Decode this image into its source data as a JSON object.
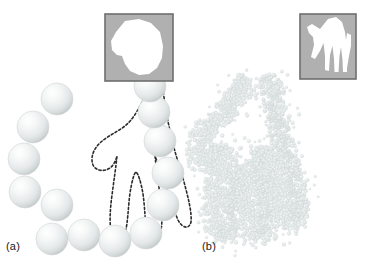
{
  "figure": {
    "type": "diagram",
    "background_color": "#ffffff"
  },
  "panels": [
    {
      "id": "a",
      "label": "(a)",
      "marker_kind": "sphere",
      "marker_count": 14,
      "marker_diameter_px": 32,
      "marker_fill_light": "#ffffff",
      "marker_fill_mid": "#eceeee",
      "marker_fill_dark": "#c9cdcd",
      "contour_style": "dashed",
      "contour_color": "#2b2b2b",
      "contour_dash": "2.2 2.2",
      "contour_width_px": 1.6,
      "spheres": [
        {
          "cx": 57,
          "cy": 99
        },
        {
          "cx": 33,
          "cy": 127
        },
        {
          "cx": 24,
          "cy": 159
        },
        {
          "cx": 25,
          "cy": 192
        },
        {
          "cx": 57,
          "cy": 205
        },
        {
          "cx": 52,
          "cy": 239
        },
        {
          "cx": 84,
          "cy": 235
        },
        {
          "cx": 115,
          "cy": 241
        },
        {
          "cx": 146,
          "cy": 233
        },
        {
          "cx": 163,
          "cy": 205
        },
        {
          "cx": 168,
          "cy": 173
        },
        {
          "cx": 160,
          "cy": 141
        },
        {
          "cx": 154,
          "cy": 112
        },
        {
          "cx": 150,
          "cy": 86
        }
      ],
      "inset": {
        "x": 105,
        "y": 14,
        "width": 68,
        "height": 67,
        "border_color": "#6e6e6e",
        "background_color": "#b0b0b0",
        "shape_color": "#ffffff",
        "shape_name": "partial-hand-silhouette"
      }
    },
    {
      "id": "b",
      "label": "(b)",
      "marker_kind": "dot",
      "marker_count": 1100,
      "marker_diameter_px": 3.2,
      "marker_fill": "#e2e6e6",
      "marker_stroke": "#d2d8d8",
      "contour_style": "point-cloud",
      "inset": {
        "x": 300,
        "y": 14,
        "width": 56,
        "height": 65,
        "border_color": "#6e6e6e",
        "background_color": "#b0b0b0",
        "shape_color": "#ffffff",
        "shape_name": "full-hand-silhouette"
      }
    }
  ],
  "hand_outline_points": "150,86 142,104 133,120 120,132 106,139 96,149 92,160 96,168 104,170 112,166 116,158 116,168 114,182 112,196 110,212 110,228 114,236 120,238 125,232 127,218 129,202 132,186 136,176 140,186 143,202 145,218 147,232 152,238 158,236 161,228 161,212 159,196 157,182 155,168 155,158 159,168 163,178 168,190 172,204 176,218 181,228 187,229 191,222 189,208 185,192 181,176 177,162 173,150 170,138 167,126 165,112 163,98",
  "inset_shapes": {
    "left_partial_hand_path": "M 18 6 L 44 4 L 56 16 L 60 34 L 58 48 L 48 58 L 34 60 L 22 54 L 16 44 L 10 40 L 6 30 L 10 18 Z",
    "right_hand_path": "M 30 4 L 40 2 L 46 14 L 48 26 L 50 18 L 54 22 L 53 34 L 50 44 L 48 56 L 44 56 L 43 44 L 41 34 L 39 44 L 38 58 L 34 58 L 33 44 L 31 32 L 28 42 L 27 56 L 23 55 L 23 40 L 22 28 L 18 36 L 14 44 L 10 42 L 13 30 L 12 22 L 8 18 L 6 12 L 12 10 L 20 14 Z"
  }
}
